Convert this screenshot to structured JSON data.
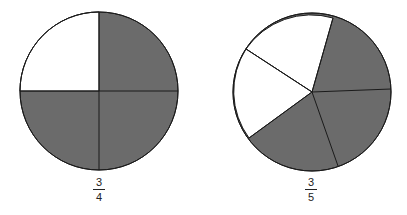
{
  "figures": [
    {
      "name": "three-quarters",
      "parts": 4,
      "shaded": 3,
      "label": {
        "numerator": "3",
        "denominator": "4"
      }
    },
    {
      "name": "three-fifths",
      "parts": 5,
      "shaded": 3,
      "label": {
        "numerator": "3",
        "denominator": "5"
      }
    }
  ],
  "colors": {
    "shaded": "#6b6b6b",
    "unshaded": "#ffffff",
    "stroke": "#1a1a1a"
  }
}
